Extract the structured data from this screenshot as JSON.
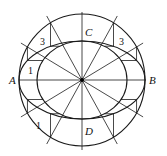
{
  "figure": {
    "stroke_color": "#1a1a1a",
    "background_color": "#ffffff",
    "ray_count": 12,
    "labels": {
      "A": "A",
      "B": "B",
      "C": "C",
      "D": "D"
    },
    "step_labels": [
      {
        "id": "top-left",
        "text": "3"
      },
      {
        "id": "top-right",
        "text": "3"
      },
      {
        "id": "left-upper",
        "text": "1"
      },
      {
        "id": "bottom-left",
        "text": "1"
      }
    ]
  }
}
